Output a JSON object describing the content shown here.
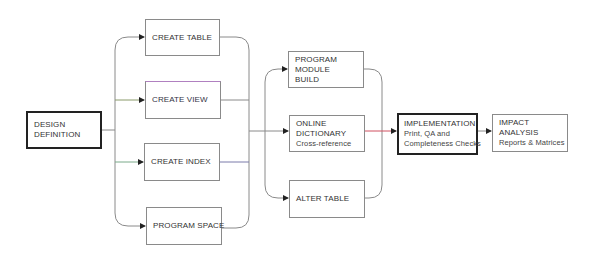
{
  "diagram": {
    "type": "flowchart",
    "nodes": {
      "design_definition": {
        "lines": [
          "DESIGN",
          "DEFINITION"
        ]
      },
      "create_table": {
        "lines": [
          "CREATE TABLE"
        ]
      },
      "create_view": {
        "lines": [
          "CREATE VIEW"
        ]
      },
      "create_index": {
        "lines": [
          "CREATE INDEX"
        ]
      },
      "program_space": {
        "lines": [
          "PROGRAM SPACE"
        ]
      },
      "program_module_build": {
        "lines": [
          "PROGRAM",
          "MODULE",
          "BUILD"
        ]
      },
      "online_dictionary": {
        "lines": [
          "ONLINE",
          "DICTIONARY",
          "Cross-reference"
        ]
      },
      "alter_table": {
        "lines": [
          "ALTER TABLE"
        ]
      },
      "implementation": {
        "title": "IMPLEMENTATION",
        "lines": [
          "Print, QA and",
          "Completeness Checks"
        ]
      },
      "impact_analysis": {
        "lines": [
          "IMPACT",
          "ANALYSIS",
          "Reports & Matrices"
        ]
      }
    },
    "edges": [
      {
        "from": "design_definition",
        "to": [
          "create_table",
          "create_view",
          "create_index",
          "program_space"
        ]
      },
      {
        "from": [
          "create_table",
          "create_view",
          "create_index",
          "program_space"
        ],
        "to": [
          "program_module_build",
          "online_dictionary",
          "alter_table"
        ]
      },
      {
        "from": "online_dictionary",
        "to": "implementation"
      },
      {
        "from": "implementation",
        "to": "impact_analysis"
      }
    ],
    "colors": {
      "line": "#8a8a8a",
      "arrowhead": "#222222",
      "accent_line": "#d05060"
    }
  }
}
